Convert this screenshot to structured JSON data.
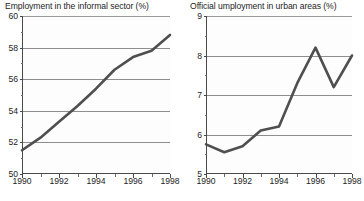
{
  "page": {
    "kind": "scanned-figure-pair",
    "background": "#ffffff",
    "line_color": "#4f4f4f",
    "grid_color": "#8e8e8e",
    "axis_color": "#4a4a4a",
    "text_color": "#1d1d1d"
  },
  "chart_data": [
    {
      "type": "line",
      "id": "employment-informal-sector",
      "title": "Employment in the informal sector (%)",
      "xlabel": "",
      "ylabel": "",
      "xlim": [
        1990,
        1998
      ],
      "ylim": [
        50,
        60
      ],
      "grid": true,
      "legend": "none",
      "x": [
        1990,
        1991,
        1992,
        1993,
        1994,
        1995,
        1996,
        1997,
        1998
      ],
      "values": [
        51.5,
        52.3,
        53.3,
        54.3,
        55.4,
        56.6,
        57.4,
        57.8,
        58.8
      ],
      "xticks": [
        1990,
        1992,
        1994,
        1996,
        1998
      ],
      "xtick_labels": [
        "1990",
        "1992",
        "1994",
        "1996",
        "1998"
      ],
      "xticks_minor": [
        1991,
        1993,
        1995,
        1997
      ],
      "yticks": [
        50,
        52,
        54,
        56,
        58,
        60
      ],
      "ytick_labels": [
        "50",
        "52",
        "54",
        "56",
        "58",
        "60"
      ],
      "gridlines": [
        52,
        54,
        56,
        58,
        60
      ]
    },
    {
      "type": "line",
      "id": "official-unemployment-urban",
      "title": "Official umployment in urban areas (%)",
      "xlabel": "",
      "ylabel": "",
      "xlim": [
        1990,
        1998
      ],
      "ylim": [
        5,
        9
      ],
      "grid": true,
      "legend": "none",
      "x": [
        1990,
        1991,
        1992,
        1993,
        1994,
        1995,
        1996,
        1997,
        1998
      ],
      "values": [
        5.75,
        5.55,
        5.7,
        6.1,
        6.2,
        7.3,
        8.2,
        7.2,
        8.0
      ],
      "xticks": [
        1990,
        1992,
        1994,
        1996,
        1998
      ],
      "xtick_labels": [
        "1990",
        "1992",
        "1994",
        "1996",
        "1998"
      ],
      "xticks_minor": [
        1991,
        1993,
        1995,
        1997
      ],
      "yticks": [
        5,
        6,
        7,
        8,
        9
      ],
      "ytick_labels": [
        "5",
        "6",
        "7",
        "8",
        "9"
      ],
      "gridlines": [
        6,
        7,
        8,
        9
      ]
    }
  ]
}
